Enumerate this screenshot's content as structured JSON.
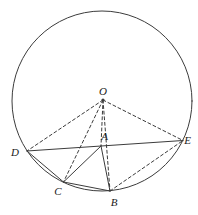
{
  "figure": {
    "type": "geometry-diagram",
    "colors": {
      "background": "#ffffff",
      "stroke": "#3c3c3c",
      "label": "#1a1a1a"
    },
    "stroke_width": 1,
    "dash_pattern": "3 2.6",
    "circle": {
      "cx": 102,
      "cy": 101,
      "r": 90
    },
    "center_dot": {
      "x": 103,
      "y": 100,
      "r": 1.6
    },
    "points": {
      "O": {
        "x": 103,
        "y": 100
      },
      "A": {
        "x": 101,
        "y": 146
      },
      "B": {
        "x": 110,
        "y": 191
      },
      "C": {
        "x": 63.5,
        "y": 182
      },
      "D": {
        "x": 27,
        "y": 151
      },
      "E": {
        "x": 183,
        "y": 140.5
      }
    },
    "labels": [
      {
        "text": "O",
        "x": 103,
        "y": 95
      },
      {
        "text": "A",
        "x": 104.5,
        "y": 140
      },
      {
        "text": "B",
        "x": 114,
        "y": 205.5
      },
      {
        "text": "C",
        "x": 58,
        "y": 194.5
      },
      {
        "text": "D",
        "x": 15,
        "y": 156
      },
      {
        "text": "E",
        "x": 187.5,
        "y": 143.5
      }
    ],
    "edges": [
      {
        "from": "D",
        "to": "E",
        "style": "solid",
        "name": "chord-DE"
      },
      {
        "from": "D",
        "to": "C",
        "style": "solid",
        "name": "chord-DC"
      },
      {
        "from": "C",
        "to": "B",
        "style": "solid",
        "name": "chord-CB"
      },
      {
        "from": "A",
        "to": "C",
        "style": "solid",
        "name": "segment-AC"
      },
      {
        "from": "A",
        "to": "B",
        "style": "solid",
        "name": "segment-AB"
      },
      {
        "from": "O",
        "to": "D",
        "style": "dashed",
        "name": "radius-OD"
      },
      {
        "from": "O",
        "to": "C",
        "style": "dashed",
        "name": "radius-OC"
      },
      {
        "from": "O",
        "to": "A",
        "style": "dashed",
        "name": "segment-OA"
      },
      {
        "from": "O",
        "to": "B",
        "style": "dashed",
        "name": "radius-OB"
      },
      {
        "from": "O",
        "to": "E",
        "style": "dashed",
        "name": "radius-OE"
      },
      {
        "from": "B",
        "to": "E",
        "style": "dashed",
        "name": "chord-BE"
      }
    ]
  }
}
